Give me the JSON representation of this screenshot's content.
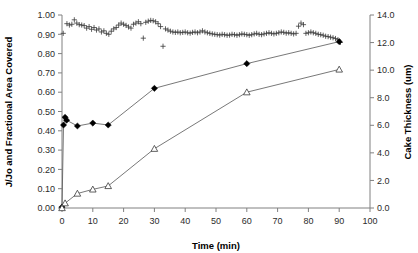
{
  "chart_data": {
    "type": "scatter",
    "title": "",
    "xlabel": "Time (min)",
    "ylabel": "J/Jo and Fractional Area Covered",
    "y2label": "Cake Thickness (um)",
    "xlim": [
      0,
      100
    ],
    "ylim": [
      0.0,
      1.0
    ],
    "y2lim": [
      0.0,
      14.0
    ],
    "xticks": [
      0,
      10,
      20,
      30,
      40,
      50,
      60,
      70,
      80,
      90,
      100
    ],
    "xtick_labels": [
      "0",
      "10",
      "20",
      "30",
      "40",
      "50",
      "60",
      "70",
      "80",
      "90",
      "100"
    ],
    "yticks": [
      0.0,
      0.1,
      0.2,
      0.3,
      0.4,
      0.5,
      0.6,
      0.7,
      0.8,
      0.9,
      1.0
    ],
    "ytick_labels": [
      "0.00",
      "0.10",
      "0.20",
      "0.30",
      "0.40",
      "0.50",
      "0.60",
      "0.70",
      "0.80",
      "0.90",
      "1.00"
    ],
    "y2ticks": [
      0.0,
      2.0,
      4.0,
      6.0,
      8.0,
      10.0,
      12.0,
      14.0
    ],
    "y2tick_labels": [
      "0.0",
      "2.0",
      "4.0",
      "6.0",
      "8.0",
      "10.0",
      "12.0",
      "14.0"
    ],
    "grid": false,
    "legend": "none",
    "series": [
      {
        "name": "J/Jo",
        "marker": "plus",
        "axis": "left",
        "line": false,
        "points": [
          [
            0.4,
            0.905
          ],
          [
            1.6,
            0.955
          ],
          [
            2.4,
            0.948
          ],
          [
            3.2,
            0.952
          ],
          [
            4.0,
            0.975
          ],
          [
            4.8,
            0.958
          ],
          [
            5.6,
            0.95
          ],
          [
            6.4,
            0.948
          ],
          [
            7.2,
            0.945
          ],
          [
            8.0,
            0.932
          ],
          [
            8.8,
            0.94
          ],
          [
            9.6,
            0.926
          ],
          [
            10.4,
            0.935
          ],
          [
            11.2,
            0.922
          ],
          [
            12.0,
            0.928
          ],
          [
            12.8,
            0.912
          ],
          [
            13.6,
            0.918
          ],
          [
            14.4,
            0.905
          ],
          [
            15.2,
            0.9
          ],
          [
            16.0,
            0.916
          ],
          [
            16.8,
            0.928
          ],
          [
            17.6,
            0.935
          ],
          [
            18.4,
            0.948
          ],
          [
            19.2,
            0.958
          ],
          [
            20.0,
            0.952
          ],
          [
            20.8,
            0.946
          ],
          [
            21.6,
            0.938
          ],
          [
            22.4,
            0.932
          ],
          [
            23.2,
            0.952
          ],
          [
            24.0,
            0.958
          ],
          [
            24.8,
            0.965
          ],
          [
            25.6,
            0.955
          ],
          [
            26.4,
            0.88
          ],
          [
            27.2,
            0.962
          ],
          [
            28.0,
            0.968
          ],
          [
            28.8,
            0.972
          ],
          [
            29.6,
            0.97
          ],
          [
            30.4,
            0.965
          ],
          [
            31.2,
            0.955
          ],
          [
            32.0,
            0.94
          ],
          [
            32.8,
            0.838
          ],
          [
            33.6,
            0.928
          ],
          [
            34.4,
            0.922
          ],
          [
            35.2,
            0.916
          ],
          [
            36.0,
            0.912
          ],
          [
            36.8,
            0.91
          ],
          [
            37.6,
            0.912
          ],
          [
            38.4,
            0.908
          ],
          [
            39.2,
            0.91
          ],
          [
            40.0,
            0.912
          ],
          [
            40.8,
            0.908
          ],
          [
            41.6,
            0.906
          ],
          [
            42.4,
            0.91
          ],
          [
            43.2,
            0.912
          ],
          [
            44.0,
            0.908
          ],
          [
            44.8,
            0.912
          ],
          [
            45.6,
            0.918
          ],
          [
            46.4,
            0.912
          ],
          [
            47.2,
            0.908
          ],
          [
            48.0,
            0.905
          ],
          [
            48.8,
            0.902
          ],
          [
            49.6,
            0.9
          ],
          [
            50.4,
            0.898
          ],
          [
            51.2,
            0.896
          ],
          [
            52.0,
            0.9
          ],
          [
            52.8,
            0.898
          ],
          [
            53.6,
            0.895
          ],
          [
            54.4,
            0.896
          ],
          [
            55.2,
            0.9
          ],
          [
            56.0,
            0.898
          ],
          [
            56.8,
            0.895
          ],
          [
            57.6,
            0.898
          ],
          [
            58.4,
            0.902
          ],
          [
            59.2,
            0.9
          ],
          [
            60.0,
            0.898
          ],
          [
            60.8,
            0.895
          ],
          [
            61.6,
            0.898
          ],
          [
            62.4,
            0.902
          ],
          [
            63.2,
            0.905
          ],
          [
            64.0,
            0.9
          ],
          [
            64.8,
            0.898
          ],
          [
            65.6,
            0.902
          ],
          [
            66.4,
            0.905
          ],
          [
            67.2,
            0.908
          ],
          [
            68.0,
            0.905
          ],
          [
            68.8,
            0.902
          ],
          [
            69.6,
            0.905
          ],
          [
            70.4,
            0.908
          ],
          [
            71.2,
            0.912
          ],
          [
            72.0,
            0.91
          ],
          [
            72.8,
            0.906
          ],
          [
            73.6,
            0.908
          ],
          [
            74.4,
            0.905
          ],
          [
            75.2,
            0.902
          ],
          [
            76.0,
            0.905
          ],
          [
            76.8,
            0.942
          ],
          [
            77.6,
            0.958
          ],
          [
            78.4,
            0.95
          ],
          [
            79.2,
            0.905
          ],
          [
            80.0,
            0.908
          ],
          [
            80.8,
            0.912
          ],
          [
            81.6,
            0.908
          ],
          [
            82.4,
            0.905
          ],
          [
            83.2,
            0.9
          ],
          [
            84.0,
            0.898
          ],
          [
            84.8,
            0.895
          ],
          [
            85.6,
            0.89
          ],
          [
            86.4,
            0.888
          ],
          [
            87.2,
            0.885
          ],
          [
            88.0,
            0.882
          ],
          [
            88.8,
            0.878
          ],
          [
            89.6,
            0.872
          ],
          [
            90.4,
            0.858
          ]
        ]
      },
      {
        "name": "Fractional Area Covered",
        "marker": "diamond-filled",
        "axis": "left",
        "line": true,
        "points": [
          [
            0.0,
            0.005
          ],
          [
            0.5,
            0.43
          ],
          [
            1.0,
            0.47
          ],
          [
            1.5,
            0.455
          ],
          [
            5.0,
            0.425
          ],
          [
            10.0,
            0.44
          ],
          [
            15.0,
            0.43
          ],
          [
            30.0,
            0.62
          ],
          [
            60.0,
            0.748
          ],
          [
            90.0,
            0.862
          ]
        ]
      },
      {
        "name": "Cake Thickness",
        "marker": "triangle-open",
        "axis": "right",
        "line": true,
        "points": [
          [
            0.0,
            0.0
          ],
          [
            1.0,
            0.35
          ],
          [
            5.0,
            1.05
          ],
          [
            10.0,
            1.35
          ],
          [
            15.0,
            1.6
          ],
          [
            30.0,
            4.3
          ],
          [
            60.0,
            8.4
          ],
          [
            90.0,
            10.05
          ]
        ]
      }
    ]
  }
}
